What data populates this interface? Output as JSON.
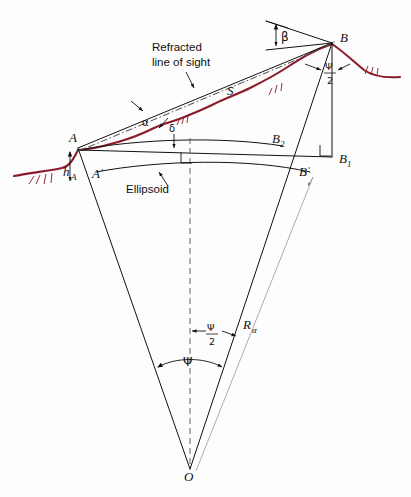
{
  "figure": {
    "background_color": "#fdfdfd",
    "line_color": "#111111",
    "terrain_color": "#8B1A2A",
    "thin_line_color": "#8a8a8a"
  },
  "labels": {
    "point_a": "A",
    "point_a_prime": "Aˈ",
    "point_b": "B",
    "point_b_prime": "Bˈ",
    "point_b1": "B",
    "point_b1_sub": "1",
    "point_b2": "B",
    "point_b2_sub": "2",
    "point_o": "O",
    "height_a": "h",
    "height_a_sub": "A",
    "slope_distance": "S",
    "alpha": "α",
    "beta": "β",
    "delta": "δ",
    "psi": "Ψ",
    "psi_half_num": "Ψ",
    "psi_half_den": "2",
    "radius": "R",
    "radius_sub": "α",
    "refracted_line_1": "Refracted",
    "refracted_line_2": "line of sight",
    "ellipsoid": "Ellipsoid"
  },
  "annotations": [
    {
      "name": "refracted-line-of-sight",
      "text": "Refracted line of sight",
      "points_to": "dash-dot curved ray from A to B"
    },
    {
      "name": "ellipsoid",
      "text": "Ellipsoid",
      "points_to": "lower arc Aˈ to Bˈ"
    },
    {
      "name": "slope-distance",
      "text": "S",
      "describes": "straight chord from A to B"
    },
    {
      "name": "alpha-angle",
      "text": "α",
      "describes": "vertical angle at A between refracted ray tangent and chord"
    },
    {
      "name": "beta-angle",
      "text": "β",
      "describes": "vertical angle at B measured from horizontal at B"
    },
    {
      "name": "delta-angle",
      "text": "δ",
      "describes": "angle between chord and level arc through A"
    },
    {
      "name": "psi-angle",
      "text": "Ψ",
      "describes": "central angle at O subtended by Aˈ and Bˈ"
    },
    {
      "name": "psi-half-angle",
      "text": "Ψ/2",
      "describes": "half the central angle"
    },
    {
      "name": "radius-alpha",
      "text": "Rα",
      "describes": "radius of curvature from O to Bˈ"
    },
    {
      "name": "height-above-ellipsoid",
      "text": "hA",
      "describes": "height of A above the ellipsoid"
    }
  ],
  "geometry": {
    "A": [
      78,
      148
    ],
    "A_prime": [
      96,
      172
    ],
    "B": [
      332,
      43
    ],
    "B_prime": [
      310,
      172
    ],
    "B1": [
      332,
      157
    ],
    "B2": [
      283,
      146
    ],
    "O": [
      190,
      469
    ],
    "center_axis_x": 190
  }
}
